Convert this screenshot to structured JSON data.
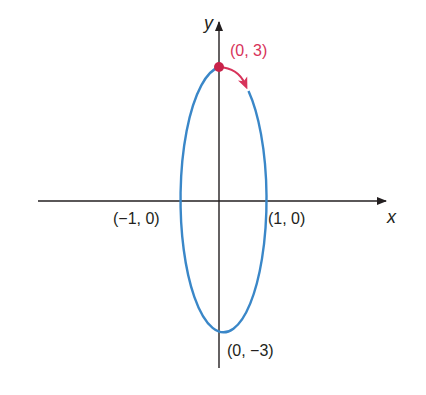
{
  "diagram": {
    "type": "ellipse-parametric-orientation",
    "axes": {
      "x_label": "x",
      "y_label": "y"
    },
    "points": {
      "top": "(0, 3)",
      "bottom": "(0, −3)",
      "left": "(−1, 0)",
      "right": "(1, 0)"
    },
    "colors": {
      "curve": "#3a87c8",
      "highlight": "#d7335a",
      "axis": "#231f20"
    },
    "direction": "clockwise"
  }
}
